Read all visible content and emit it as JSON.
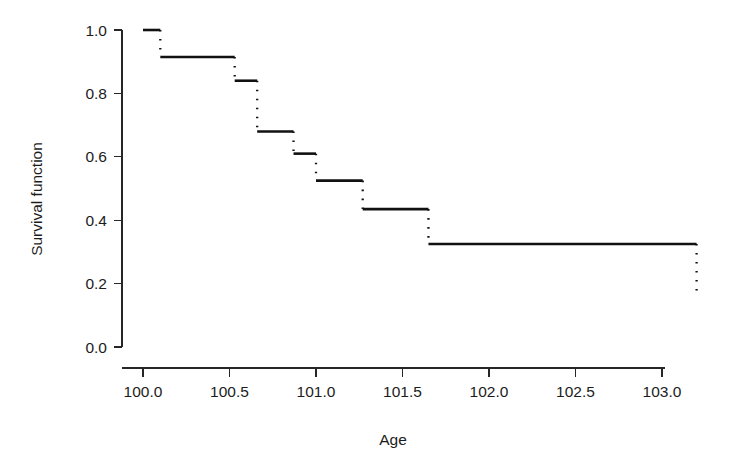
{
  "chart_data": {
    "type": "line",
    "title": "",
    "subtitle": "",
    "xlabel": "Age",
    "ylabel": "Survival function",
    "xlim": [
      99.88,
      103.2
    ],
    "ylim": [
      0.0,
      1.0
    ],
    "grid": false,
    "legend": null,
    "style": "kaplan-meier step function, vertical drops drawn as dotted lines",
    "x_ticks": [
      100.0,
      100.5,
      101.0,
      101.5,
      102.0,
      102.5,
      103.0
    ],
    "x_tick_labels": [
      "100.0",
      "100.5",
      "101.0",
      "101.5",
      "102.0",
      "102.5",
      "103.0"
    ],
    "y_ticks": [
      0.0,
      0.2,
      0.4,
      0.6,
      0.8,
      1.0
    ],
    "y_tick_labels": [
      "0.0",
      "0.2",
      "0.4",
      "0.6",
      "0.8",
      "1.0"
    ],
    "line_color": "#111111",
    "steps": [
      {
        "x_start": 100.0,
        "x_end": 100.1,
        "y": 1.0
      },
      {
        "x_start": 100.1,
        "x_end": 100.53,
        "y": 0.915
      },
      {
        "x_start": 100.53,
        "x_end": 100.66,
        "y": 0.84
      },
      {
        "x_start": 100.66,
        "x_end": 100.87,
        "y": 0.68
      },
      {
        "x_start": 100.87,
        "x_end": 101.0,
        "y": 0.61
      },
      {
        "x_start": 101.0,
        "x_end": 101.27,
        "y": 0.525
      },
      {
        "x_start": 101.27,
        "x_end": 101.65,
        "y": 0.435
      },
      {
        "x_start": 101.65,
        "x_end": 103.2,
        "y": 0.325
      }
    ],
    "drops": [
      {
        "x": 100.1,
        "y_from": 1.0,
        "y_to": 0.915
      },
      {
        "x": 100.53,
        "y_from": 0.915,
        "y_to": 0.84
      },
      {
        "x": 100.66,
        "y_from": 0.84,
        "y_to": 0.68
      },
      {
        "x": 100.87,
        "y_from": 0.68,
        "y_to": 0.61
      },
      {
        "x": 101.0,
        "y_from": 0.61,
        "y_to": 0.525
      },
      {
        "x": 101.27,
        "y_from": 0.525,
        "y_to": 0.435
      },
      {
        "x": 101.65,
        "y_from": 0.435,
        "y_to": 0.325
      },
      {
        "x": 103.2,
        "y_from": 0.325,
        "y_to": 0.17
      }
    ],
    "x": [
      100.0,
      100.1,
      100.53,
      100.66,
      100.87,
      101.0,
      101.27,
      101.65,
      103.2
    ],
    "y": [
      1.0,
      0.915,
      0.84,
      0.68,
      0.61,
      0.525,
      0.435,
      0.325,
      0.17
    ]
  }
}
